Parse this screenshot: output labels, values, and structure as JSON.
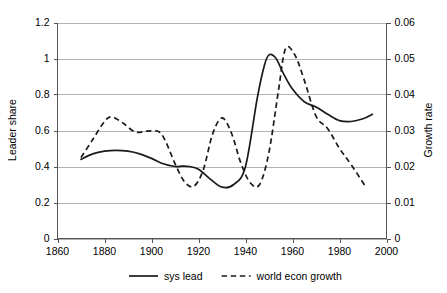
{
  "chart_data": {
    "type": "line",
    "title": "",
    "xlabel": "",
    "ylabel": "Leader share",
    "y2label": "Growth rate",
    "xlim": [
      1860,
      2000
    ],
    "ylim": [
      0,
      1.2
    ],
    "y2lim": [
      0,
      0.06
    ],
    "grid": true,
    "legend_position": "bottom",
    "xticks": [
      "1860",
      "1880",
      "1900",
      "1920",
      "1940",
      "1960",
      "1980",
      "2000"
    ],
    "xtick_values": [
      1860,
      1880,
      1900,
      1920,
      1940,
      1960,
      1980,
      2000
    ],
    "yticks": [
      "0",
      "0.2",
      "0.4",
      "0.6",
      "0.8",
      "1",
      "1.2"
    ],
    "ytick_values": [
      0,
      0.2,
      0.4,
      0.6,
      0.8,
      1,
      1.2
    ],
    "y2ticks": [
      "0",
      "0.01",
      "0.02",
      "0.03",
      "0.04",
      "0.05",
      "0.06"
    ],
    "y2tick_values": [
      0,
      0.01,
      0.02,
      0.03,
      0.04,
      0.05,
      0.06
    ],
    "series": [
      {
        "name": "sys lead",
        "axis": "left",
        "style": "solid",
        "x": [
          1870,
          1875,
          1880,
          1885,
          1890,
          1895,
          1900,
          1905,
          1910,
          1913,
          1916,
          1920,
          1925,
          1930,
          1935,
          1940,
          1945,
          1948,
          1950,
          1953,
          1956,
          1960,
          1965,
          1970,
          1975,
          1980,
          1985,
          1990,
          1994
        ],
        "values": [
          0.44,
          0.47,
          0.485,
          0.49,
          0.485,
          0.47,
          0.445,
          0.415,
          0.4,
          0.402,
          0.4,
          0.385,
          0.33,
          0.285,
          0.3,
          0.4,
          0.78,
          0.96,
          1.02,
          1.0,
          0.92,
          0.83,
          0.76,
          0.73,
          0.69,
          0.655,
          0.65,
          0.665,
          0.69
        ]
      },
      {
        "name": "world econ growth",
        "axis": "right",
        "style": "dashed",
        "x": [
          1870,
          1875,
          1880,
          1883,
          1888,
          1893,
          1898,
          1903,
          1906,
          1910,
          1914,
          1918,
          1922,
          1926,
          1930,
          1934,
          1938,
          1942,
          1946,
          1950,
          1954,
          1957,
          1961,
          1965,
          1970,
          1975,
          1980,
          1985,
          1991
        ],
        "values": [
          0.0225,
          0.0275,
          0.0325,
          0.0338,
          0.032,
          0.0296,
          0.0298,
          0.0297,
          0.027,
          0.0208,
          0.0158,
          0.0145,
          0.019,
          0.029,
          0.0335,
          0.0293,
          0.021,
          0.0155,
          0.015,
          0.024,
          0.041,
          0.0527,
          0.051,
          0.044,
          0.034,
          0.0305,
          0.025,
          0.0205,
          0.0145
        ]
      }
    ],
    "legend": [
      {
        "label": "sys lead",
        "style": "solid"
      },
      {
        "label": "world econ growth",
        "style": "dashed"
      }
    ]
  }
}
